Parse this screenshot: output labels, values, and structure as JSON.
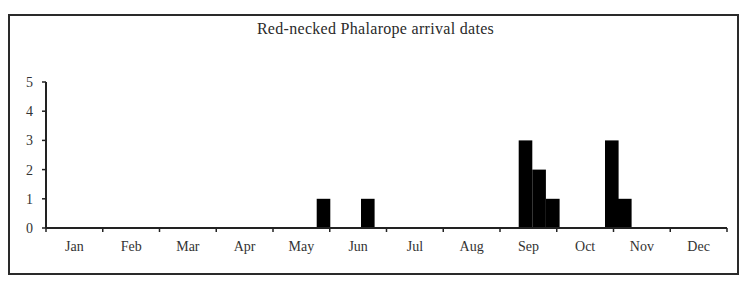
{
  "chart_data": {
    "type": "bar",
    "title": "Red-necked Phalarope arrival dates",
    "xlabel": "",
    "ylabel": "",
    "ylim": [
      0,
      5
    ],
    "yticks": [
      0,
      1,
      2,
      3,
      4,
      5
    ],
    "grid": false,
    "legend": null,
    "categories": [
      "Jan",
      "Feb",
      "Mar",
      "Apr",
      "May",
      "Jun",
      "Jul",
      "Aug",
      "Sep",
      "Oct",
      "Nov",
      "Dec"
    ],
    "bar_color": "#000000",
    "bars": [
      {
        "month": "May",
        "position": "late May",
        "month_offset": 4.77,
        "value": 1
      },
      {
        "month": "Jun",
        "position": "mid Jun",
        "month_offset": 5.55,
        "value": 1
      },
      {
        "month": "Sep",
        "position": "early Sep (1)",
        "month_offset": 8.33,
        "value": 3
      },
      {
        "month": "Sep",
        "position": "early Sep (2)",
        "month_offset": 8.57,
        "value": 2
      },
      {
        "month": "Sep",
        "position": "early Sep (3)",
        "month_offset": 8.81,
        "value": 1
      },
      {
        "month": "Oct",
        "position": "late Oct (1)",
        "month_offset": 9.85,
        "value": 3
      },
      {
        "month": "Oct",
        "position": "late Oct (2)",
        "month_offset": 10.08,
        "value": 1
      }
    ]
  }
}
